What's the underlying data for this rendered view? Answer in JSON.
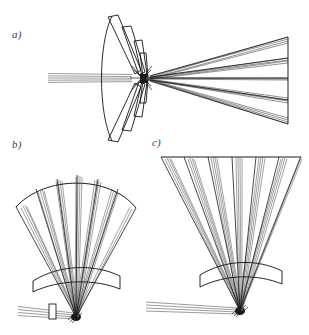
{
  "figure": {
    "background_color": "#ffffff",
    "ink_color": "#1a1a1a",
    "ray_color": "#555555",
    "width": 309,
    "height": 335,
    "panel_count": 3
  },
  "panels": [
    {
      "id": "a",
      "label": "a)",
      "orientation": "horizontal",
      "description": "Collimated beam enters from the left, passes through an arc of faceted lens elements, converges at a central focus, then diverges into a five-bundle fan that terminates on a vertical flat detector plane at the right.",
      "input_beam": {
        "direction": "left-to-right",
        "ray_count": 5,
        "is_collimated": true,
        "has_aperture_stop": false
      },
      "optic": {
        "type": "faceted-arc-lens-stack",
        "facet_count": 8,
        "arrangement": "arc opening to the left",
        "is_curved": true
      },
      "focus": {
        "present": true,
        "position": "center",
        "x": 143,
        "y": 78
      },
      "output_fan": {
        "bundle_count": 5,
        "direction": "rightward diverging",
        "terminator": "vertical flat plane",
        "terminator_shape": "flat"
      }
    },
    {
      "id": "b",
      "label": "b)",
      "orientation": "vertical",
      "description": "Collimated beam enters horizontally from the left through a rectangular aperture stop, reaches a focus, then a meniscus lens redirects the light upward into a six-sector fan terminating on a curved (arc) detector surface.",
      "input_beam": {
        "direction": "left-to-right",
        "ray_count": 4,
        "is_collimated": true,
        "has_aperture_stop": true
      },
      "aperture_stop": {
        "shape": "rectangle",
        "label": "aperture stop",
        "x": 49,
        "y": 304,
        "width": 7,
        "height": 15
      },
      "optic": {
        "type": "meniscus-lens",
        "facet_count": 1,
        "arrangement": "convex-up arc above focus",
        "is_curved": true
      },
      "focus": {
        "present": true,
        "position": "bottom",
        "x": 74,
        "y": 318
      },
      "output_fan": {
        "bundle_count": 6,
        "direction": "upward diverging",
        "terminator": "curved arc plane",
        "terminator_shape": "curved"
      }
    },
    {
      "id": "c",
      "label": "c)",
      "orientation": "vertical",
      "description": "Collimated beam enters horizontally from the left with no aperture stop, reaches a focus, then a meniscus lens redirects the light upward into a six-sector fan terminating on a flat (straight) detector surface.",
      "input_beam": {
        "direction": "left-to-right",
        "ray_count": 4,
        "is_collimated": true,
        "has_aperture_stop": false
      },
      "optic": {
        "type": "meniscus-lens",
        "facet_count": 1,
        "arrangement": "convex-up arc above focus",
        "is_curved": true
      },
      "focus": {
        "present": true,
        "position": "bottom",
        "x": 238,
        "y": 313
      },
      "output_fan": {
        "bundle_count": 6,
        "direction": "upward diverging",
        "terminator": "flat straight plane",
        "terminator_shape": "flat"
      }
    }
  ]
}
